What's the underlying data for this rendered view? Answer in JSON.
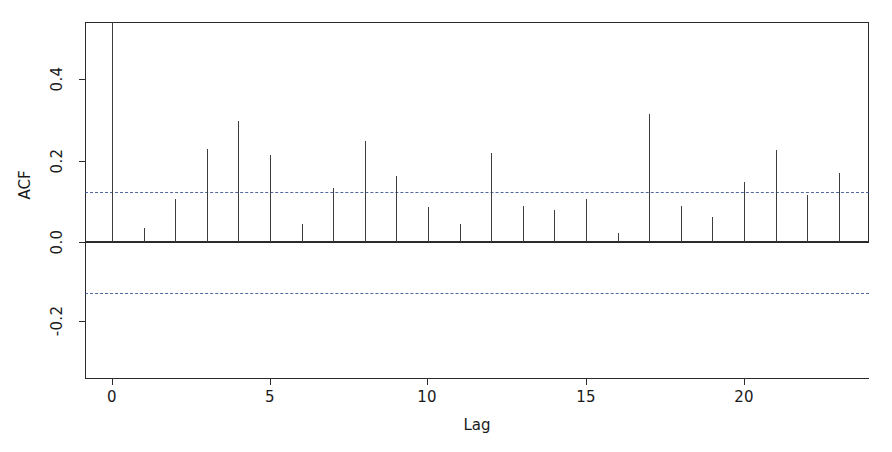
{
  "chart_data": {
    "type": "bar",
    "title": "",
    "subtitle": "",
    "xlabel": "Lag",
    "ylabel": "ACF",
    "x": [
      0,
      1,
      2,
      3,
      4,
      5,
      6,
      7,
      8,
      9,
      10,
      11,
      12,
      13,
      14,
      15,
      16,
      17,
      18,
      19,
      20,
      21,
      22,
      23
    ],
    "categories": [
      "0",
      "1",
      "2",
      "3",
      "4",
      "5",
      "6",
      "7",
      "8",
      "9",
      "10",
      "11",
      "12",
      "13",
      "14",
      "15",
      "16",
      "17",
      "18",
      "19",
      "20",
      "21",
      "22",
      "23"
    ],
    "values": [
      1.0,
      0.034,
      0.106,
      0.23,
      0.3,
      0.215,
      0.045,
      0.133,
      0.25,
      0.162,
      0.086,
      0.045,
      0.22,
      0.088,
      0.078,
      0.105,
      0.022,
      0.315,
      0.088,
      0.062,
      0.148,
      0.227,
      0.117,
      0.17
    ],
    "xlim": [
      -0.6,
      23.9
    ],
    "ylim": [
      -0.32,
      0.56
    ],
    "xticks": [
      0,
      5,
      10,
      15,
      20
    ],
    "xticklabels": [
      "0",
      "5",
      "10",
      "15",
      "20"
    ],
    "yticks": [
      -0.2,
      0.0,
      0.2,
      0.4
    ],
    "yticklabels": [
      "-0.2",
      "0.0",
      "0.2",
      "0.4"
    ],
    "grid": false,
    "legend": null,
    "annotations": [],
    "reference_lines": [
      {
        "name": "zero-line",
        "value": 0.0,
        "style": "solid",
        "color": "#2b2b2b"
      },
      {
        "name": "confidence-upper",
        "value": 0.123,
        "style": "dashed",
        "color": "#33508f"
      },
      {
        "name": "confidence-lower",
        "value": -0.127,
        "style": "dashed",
        "color": "#33508f"
      }
    ],
    "series": [
      {
        "name": "ACF",
        "values": [
          1.0,
          0.034,
          0.106,
          0.23,
          0.3,
          0.215,
          0.045,
          0.133,
          0.25,
          0.162,
          0.086,
          0.045,
          0.22,
          0.088,
          0.078,
          0.105,
          0.022,
          0.315,
          0.088,
          0.062,
          0.148,
          0.227,
          0.117,
          0.17
        ]
      }
    ]
  },
  "axes": {
    "y_title": "ACF",
    "x_title": "Lag"
  }
}
